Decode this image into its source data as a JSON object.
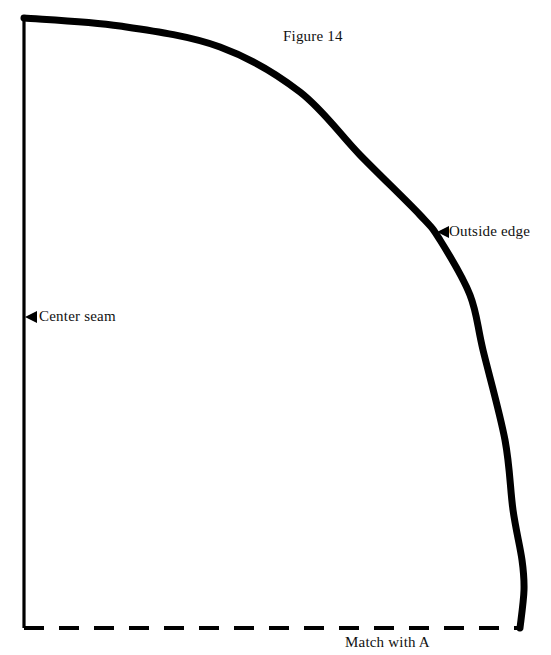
{
  "figure": {
    "title": "Figure 14",
    "background_color": "#ffffff",
    "ink_color": "#000000",
    "width": 551,
    "height": 655
  },
  "labels": {
    "title": "Figure 14",
    "outside_edge": "Outside edge",
    "center_seam": "Center seam",
    "match_with_a": "Match with A"
  },
  "chart_data": {
    "type": "line",
    "title": "Figure 14",
    "xlabel": "",
    "ylabel": "",
    "xlim": [
      0,
      551
    ],
    "ylim": [
      0,
      655
    ],
    "grid": false,
    "legend": "none",
    "series": [
      {
        "name": "center-seam",
        "style": "solid",
        "stroke_width": 3,
        "x": [
          24,
          24
        ],
        "y": [
          18,
          628
        ]
      },
      {
        "name": "bottom-edge",
        "style": "dashed",
        "stroke_width": 4,
        "dash_pattern": [
          20,
          15
        ],
        "x": [
          24,
          520
        ],
        "y": [
          628,
          628
        ]
      },
      {
        "name": "outside-edge-curve",
        "style": "solid",
        "stroke_width": 7,
        "x": [
          24,
          120,
          220,
          300,
          360,
          420,
          440,
          470,
          483,
          505,
          513,
          522,
          524,
          520
        ],
        "y": [
          18,
          26,
          47,
          92,
          155,
          215,
          240,
          295,
          350,
          440,
          510,
          560,
          590,
          628
        ]
      }
    ],
    "annotations": [
      {
        "name": "outside-edge",
        "text": "Outside edge",
        "marker": "left-pointing-triangle",
        "tip_x": 437,
        "tip_y": 232,
        "text_x": 449,
        "text_y": 232
      },
      {
        "name": "center-seam",
        "text": "Center seam",
        "marker": "left-pointing-triangle",
        "tip_x": 25,
        "tip_y": 317,
        "text_x": 39,
        "text_y": 317
      },
      {
        "name": "match-with-a",
        "text": "Match with A",
        "marker": "none",
        "text_x": 345,
        "text_y": 648
      }
    ]
  }
}
